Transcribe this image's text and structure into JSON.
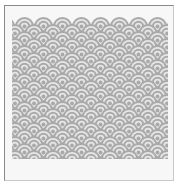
{
  "image": {
    "subject": "seigaiha wave scale pattern",
    "pattern": {
      "rows": 20,
      "columns": 8,
      "scale_width": 19,
      "row_step": 7,
      "rings_per_scale": 5,
      "origin_x": 15,
      "origin_y": 17,
      "colors": {
        "fill": "#a9a9a9",
        "ring": "#e6e6e6",
        "frame": "#8a8a8a",
        "paper": "#f7f7f7"
      }
    }
  }
}
